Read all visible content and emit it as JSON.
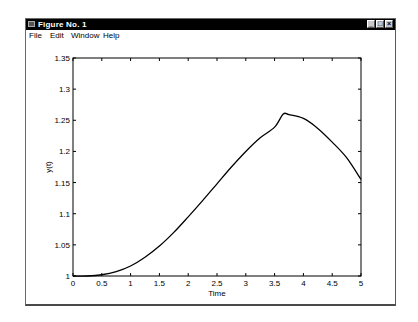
{
  "window": {
    "title": "Figure No. 1",
    "controls": {
      "minimize": "_",
      "maximize": "□",
      "close": "×"
    }
  },
  "menubar": {
    "items": [
      {
        "label": "File"
      },
      {
        "label": "Edit"
      },
      {
        "label": "Window"
      },
      {
        "label": "Help"
      }
    ]
  },
  "chart_data": {
    "type": "line",
    "title": "",
    "xlabel": "Time",
    "ylabel": "y(t)",
    "xlim": [
      0,
      5
    ],
    "ylim": [
      1,
      1.35
    ],
    "grid": false,
    "legend": null,
    "xticks": [
      "0",
      "0.5",
      "1",
      "1.5",
      "2",
      "2.5",
      "3",
      "3.5",
      "4",
      "4.5",
      "5"
    ],
    "yticks": [
      "1",
      "1.05",
      "1.1",
      "1.15",
      "1.2",
      "1.25",
      "1.3",
      "1.35"
    ],
    "series": [
      {
        "name": "y(t)",
        "color": "#000000",
        "x": [
          0,
          0.25,
          0.5,
          0.75,
          1.0,
          1.25,
          1.5,
          1.75,
          2.0,
          2.25,
          2.5,
          2.75,
          3.0,
          3.25,
          3.5,
          3.65,
          3.75,
          4.0,
          4.25,
          4.5,
          4.75,
          5.0
        ],
        "y": [
          1.0,
          1.0,
          1.002,
          1.007,
          1.016,
          1.03,
          1.048,
          1.07,
          1.095,
          1.121,
          1.148,
          1.175,
          1.2,
          1.222,
          1.239,
          1.26,
          1.259,
          1.253,
          1.237,
          1.215,
          1.19,
          1.155
        ]
      }
    ]
  }
}
